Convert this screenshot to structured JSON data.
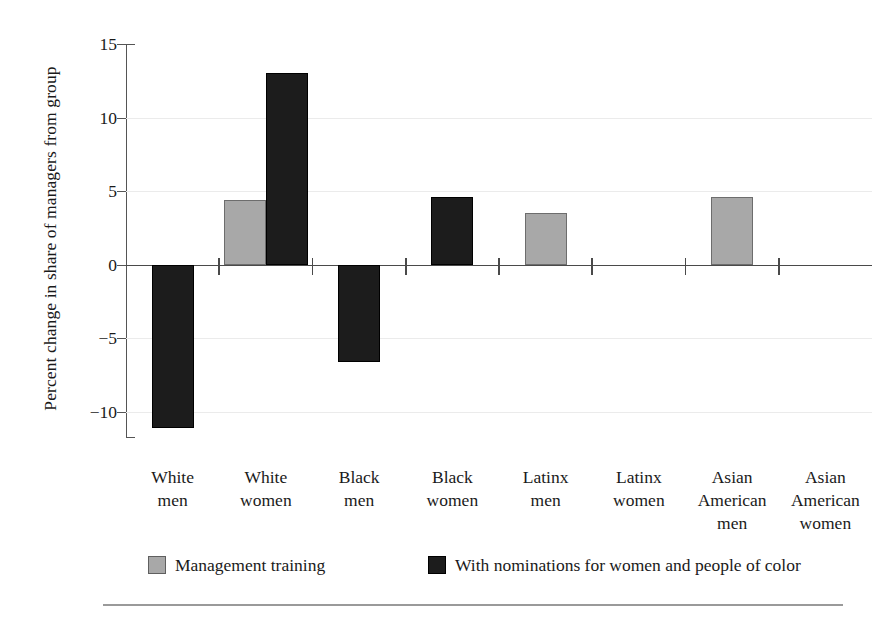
{
  "chart_data": {
    "type": "bar",
    "title": "",
    "subtitle": "",
    "xlabel": "",
    "ylabel": "Percent change in share of managers from group",
    "categories": [
      "White men",
      "White women",
      "Black men",
      "Black women",
      "Latinx men",
      "Latinx women",
      "Asian American men",
      "Asian American women"
    ],
    "category_lines": [
      [
        "White",
        "men"
      ],
      [
        "White",
        "women"
      ],
      [
        "Black",
        "men"
      ],
      [
        "Black",
        "women"
      ],
      [
        "Latinx",
        "men"
      ],
      [
        "Latinx",
        "women"
      ],
      [
        "Asian",
        "American",
        "men"
      ],
      [
        "Asian",
        "American",
        "women"
      ]
    ],
    "series": [
      {
        "name": "Management training",
        "color": "#a8a8a8",
        "values": [
          null,
          4.4,
          null,
          null,
          3.5,
          null,
          4.6,
          null
        ]
      },
      {
        "name": "With nominations for women and people of color",
        "color": "#1c1c1c",
        "values": [
          -11.1,
          13.0,
          -6.6,
          4.6,
          null,
          null,
          null,
          null
        ]
      }
    ],
    "ylim": [
      -11.8,
      15.0
    ],
    "yticks": [
      15,
      10,
      5,
      0,
      -5,
      -10
    ],
    "ytick_labels": [
      "15",
      "10",
      "5",
      "0",
      "−5",
      "−10"
    ],
    "grid": "horizontal",
    "legend_position": "bottom",
    "zero_baseline": 0
  },
  "legend": {
    "items": [
      {
        "label": "Management training",
        "swatch": "light"
      },
      {
        "label": "With nominations for women and people of color",
        "swatch": "dark"
      }
    ]
  }
}
